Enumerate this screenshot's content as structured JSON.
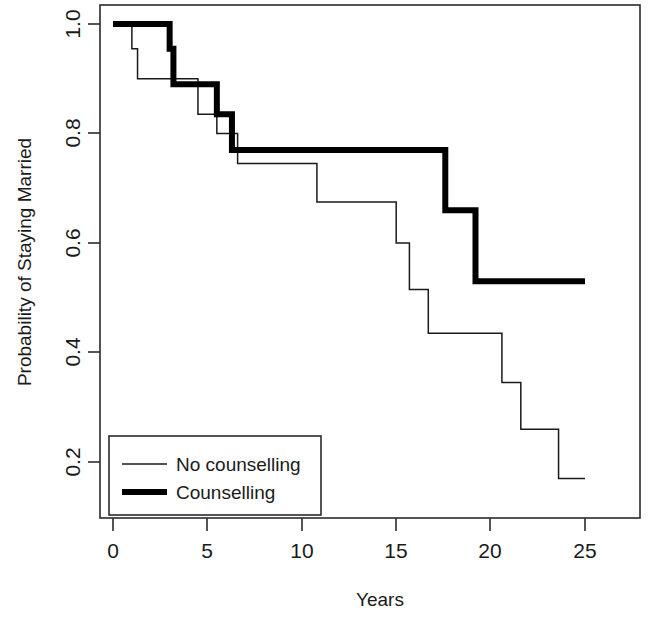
{
  "chart_data": {
    "type": "line",
    "subtype": "kaplan-meier-step",
    "title": "",
    "xlabel": "Years",
    "ylabel": "Probability of Staying Married",
    "xlim": [
      0,
      26.2
    ],
    "ylim": [
      0.155,
      1.035
    ],
    "xticks": [
      0,
      5,
      10,
      15,
      20,
      25
    ],
    "xticklabels": [
      "0",
      "5",
      "10",
      "15",
      "20",
      "25"
    ],
    "yticks": [
      0.2,
      0.4,
      0.6,
      0.8,
      1.0
    ],
    "yticklabels": [
      "0.2",
      "0.4",
      "0.6",
      "0.8",
      "1.0"
    ],
    "grid": false,
    "legend_position": "bottom-left",
    "series": [
      {
        "name": "No counselling",
        "style": "thin",
        "linewidth": 1.5,
        "color": "#1a1a1a",
        "x": [
          0.0,
          1.0,
          1.0,
          1.3,
          1.3,
          4.5,
          4.5,
          5.5,
          5.5,
          6.6,
          6.6,
          10.8,
          10.8,
          15.0,
          15.0,
          15.7,
          15.7,
          16.7,
          16.7,
          20.6,
          20.6,
          21.6,
          21.6,
          23.6,
          23.6,
          25.0
        ],
        "y": [
          1.0,
          1.0,
          0.955,
          0.955,
          0.9,
          0.9,
          0.835,
          0.835,
          0.8,
          0.8,
          0.745,
          0.745,
          0.675,
          0.675,
          0.6,
          0.6,
          0.515,
          0.515,
          0.435,
          0.435,
          0.345,
          0.345,
          0.26,
          0.26,
          0.17,
          0.17
        ],
        "steps": [
          {
            "year": 0.0,
            "prob": 1.0
          },
          {
            "year": 1.0,
            "prob": 0.955
          },
          {
            "year": 1.3,
            "prob": 0.9
          },
          {
            "year": 4.5,
            "prob": 0.835
          },
          {
            "year": 5.5,
            "prob": 0.8
          },
          {
            "year": 6.6,
            "prob": 0.745
          },
          {
            "year": 10.8,
            "prob": 0.675
          },
          {
            "year": 15.0,
            "prob": 0.6
          },
          {
            "year": 15.7,
            "prob": 0.515
          },
          {
            "year": 16.7,
            "prob": 0.435
          },
          {
            "year": 20.6,
            "prob": 0.345
          },
          {
            "year": 21.6,
            "prob": 0.26
          },
          {
            "year": 23.6,
            "prob": 0.17
          },
          {
            "year": 25.0,
            "prob": 0.17
          }
        ]
      },
      {
        "name": "Counselling",
        "style": "thick",
        "linewidth": 6,
        "color": "#000000",
        "x": [
          0.0,
          3.0,
          3.0,
          3.2,
          3.2,
          5.5,
          5.5,
          6.3,
          6.3,
          17.6,
          17.6,
          19.2,
          19.2,
          25.0
        ],
        "y": [
          1.0,
          1.0,
          0.955,
          0.955,
          0.89,
          0.89,
          0.835,
          0.835,
          0.77,
          0.77,
          0.66,
          0.66,
          0.53,
          0.53
        ],
        "steps": [
          {
            "year": 0.0,
            "prob": 1.0
          },
          {
            "year": 3.0,
            "prob": 0.955
          },
          {
            "year": 3.2,
            "prob": 0.89
          },
          {
            "year": 5.5,
            "prob": 0.835
          },
          {
            "year": 6.3,
            "prob": 0.77
          },
          {
            "year": 17.6,
            "prob": 0.66
          },
          {
            "year": 19.2,
            "prob": 0.53
          },
          {
            "year": 25.0,
            "prob": 0.53
          }
        ]
      }
    ]
  },
  "axes": {
    "x_title": "Years",
    "y_title": "Probability of Staying Married"
  },
  "legend": {
    "entries": [
      {
        "label": "No counselling",
        "style": "thin"
      },
      {
        "label": "Counselling",
        "style": "thick"
      }
    ]
  },
  "ticks": {
    "x": [
      "0",
      "5",
      "10",
      "15",
      "20",
      "25"
    ],
    "y": [
      "0.2",
      "0.4",
      "0.6",
      "0.8",
      "1.0"
    ]
  }
}
